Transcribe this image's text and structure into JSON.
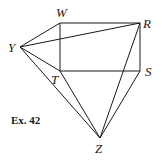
{
  "figure": {
    "caption": "Ex. 42",
    "points": {
      "W": {
        "label": "W",
        "x": 60,
        "y": 23
      },
      "R": {
        "label": "R",
        "x": 140,
        "y": 23
      },
      "Y": {
        "label": "Y",
        "x": 20,
        "y": 47
      },
      "T": {
        "label": "T",
        "x": 60,
        "y": 71
      },
      "S": {
        "label": "S",
        "x": 140,
        "y": 71
      },
      "Z": {
        "label": "Z",
        "x": 100,
        "y": 138
      }
    },
    "segments": [
      [
        "Y",
        "W"
      ],
      [
        "Y",
        "R"
      ],
      [
        "Y",
        "T"
      ],
      [
        "Y",
        "Z"
      ],
      [
        "W",
        "R"
      ],
      [
        "W",
        "T"
      ],
      [
        "R",
        "S"
      ],
      [
        "T",
        "S"
      ],
      [
        "T",
        "Z"
      ],
      [
        "R",
        "Z"
      ],
      [
        "S",
        "Z"
      ]
    ]
  }
}
